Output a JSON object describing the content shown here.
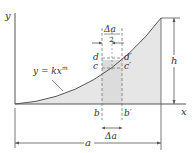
{
  "figure": {
    "axes": {
      "x_label": "x",
      "y_label": "y"
    },
    "curve": {
      "equation_lhs": "y = kx",
      "exponent": "m"
    },
    "labels": {
      "d": "d",
      "c": "c",
      "d_prime": "d′",
      "c_prime": "c′",
      "b": "b",
      "b_prime": "b′",
      "delta_a_top_num": "Δa",
      "delta_a_top_den": "2",
      "delta_a_bottom": "Δa",
      "h": "h",
      "a": "a"
    },
    "colors": {
      "shade": "#e6e6e6",
      "line": "#555555",
      "dashed": "#777777"
    }
  }
}
